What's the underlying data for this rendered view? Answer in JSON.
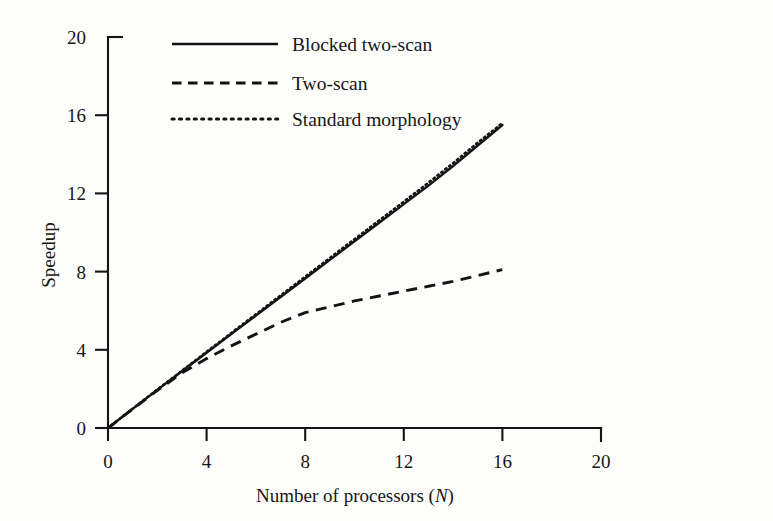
{
  "figure": {
    "background_color": "#fdfdfb",
    "ink_color": "#141414"
  },
  "axes": {
    "x_title_prefix": "Number of processors (",
    "x_title_symbol": "N",
    "x_title_suffix": ")",
    "y_title": "Speedup",
    "x_ticks": [
      "0",
      "4",
      "8",
      "12",
      "16",
      "20"
    ],
    "y_ticks": [
      "0",
      "4",
      "8",
      "12",
      "16",
      "20"
    ]
  },
  "legend": {
    "items": [
      {
        "label": "Blocked two-scan",
        "style": "solid"
      },
      {
        "label": "Two-scan",
        "style": "dashed"
      },
      {
        "label": "Standard morphology",
        "style": "dotted"
      }
    ]
  },
  "chart_data": {
    "type": "line",
    "title": "",
    "xlabel": "Number of processors (N)",
    "ylabel": "Speedup",
    "xlim": [
      0,
      20
    ],
    "ylim": [
      0,
      20
    ],
    "xticks": [
      0,
      4,
      8,
      12,
      16,
      20
    ],
    "yticks": [
      0,
      4,
      8,
      12,
      16,
      20
    ],
    "grid": false,
    "legend_position": "top-center",
    "x": [
      0,
      1,
      2,
      3,
      4,
      5,
      6,
      7,
      8,
      9,
      10,
      11,
      12,
      13,
      14,
      15,
      16
    ],
    "series": [
      {
        "name": "Blocked two-scan",
        "style": "solid",
        "values": [
          0,
          0.98,
          1.95,
          2.9,
          3.85,
          4.8,
          5.75,
          6.7,
          7.65,
          8.6,
          9.55,
          10.5,
          11.45,
          12.4,
          13.4,
          14.45,
          15.5
        ]
      },
      {
        "name": "Two-scan",
        "style": "dashed",
        "values": [
          0,
          0.97,
          1.92,
          2.82,
          3.55,
          4.2,
          4.8,
          5.4,
          5.9,
          6.2,
          6.5,
          6.75,
          7.0,
          7.25,
          7.5,
          7.8,
          8.1
        ]
      },
      {
        "name": "Standard morphology",
        "style": "dotted",
        "values": [
          0,
          0.99,
          1.97,
          2.93,
          3.9,
          4.86,
          5.82,
          6.78,
          7.74,
          8.7,
          9.66,
          10.62,
          11.58,
          12.55,
          13.55,
          14.6,
          15.6
        ]
      }
    ]
  }
}
